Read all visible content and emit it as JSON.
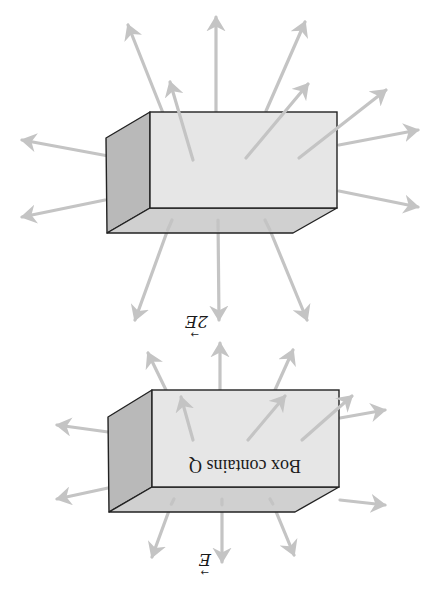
{
  "figure": {
    "orientation": "rotated 180 degrees (upside down)",
    "colors": {
      "background": "#ffffff",
      "front_face": "#e6e6e6",
      "side_face": "#b9b9b9",
      "bottom_face": "#d0d0d0",
      "edge": "#222222",
      "arrow": "#c4c4c4"
    },
    "panels": [
      {
        "name": "box-2E",
        "field_label": "2E",
        "field_label_vector": "→",
        "caption": "",
        "front": {
          "x1": 150,
          "y1": 112,
          "x2": 337,
          "y2": 208
        },
        "side": [
          [
            106,
            138
          ],
          [
            150,
            112
          ],
          [
            150,
            208
          ],
          [
            107,
            233
          ]
        ],
        "bottom": [
          [
            107,
            233
          ],
          [
            150,
            208
          ],
          [
            337,
            208
          ],
          [
            293,
            233
          ]
        ],
        "arrows": [
          [
            163,
            113,
            128,
            25
          ],
          [
            216,
            112,
            216,
            17
          ],
          [
            266,
            111,
            305,
            22
          ],
          [
            193,
            160,
            170,
            82
          ],
          [
            246,
            158,
            308,
            84
          ],
          [
            299,
            158,
            386,
            90
          ],
          [
            339,
            145,
            418,
            130
          ],
          [
            339,
            191,
            418,
            207
          ],
          [
            130,
            160,
            22,
            140
          ],
          [
            105,
            200,
            22,
            217
          ],
          [
            172,
            218,
            135,
            320
          ],
          [
            218,
            218,
            219,
            320
          ],
          [
            265,
            218,
            307,
            320
          ]
        ],
        "label_pos": {
          "x": 196,
          "y": 322
        }
      },
      {
        "name": "box-E",
        "field_label": "E",
        "field_label_vector": "→",
        "caption": "Box contains Q",
        "front": {
          "x1": 152,
          "y1": 390,
          "x2": 339,
          "y2": 487
        },
        "side": [
          [
            108,
            417
          ],
          [
            152,
            390
          ],
          [
            152,
            487
          ],
          [
            109,
            512
          ]
        ],
        "bottom": [
          [
            109,
            512
          ],
          [
            152,
            487
          ],
          [
            339,
            487
          ],
          [
            295,
            512
          ]
        ],
        "arrows": [
          [
            166,
            390,
            148,
            353
          ],
          [
            220,
            390,
            220,
            343
          ],
          [
            275,
            390,
            293,
            350
          ],
          [
            193,
            440,
            181,
            397
          ],
          [
            248,
            440,
            285,
            396
          ],
          [
            302,
            440,
            352,
            396
          ],
          [
            340,
            418,
            385,
            410
          ],
          [
            340,
            500,
            385,
            505
          ],
          [
            130,
            435,
            57,
            425
          ],
          [
            108,
            488,
            57,
            499
          ],
          [
            174,
            497,
            152,
            557
          ],
          [
            222,
            497,
            222,
            562
          ],
          [
            270,
            497,
            294,
            555
          ]
        ],
        "label_pos": {
          "x": 199,
          "y": 560
        },
        "caption_pos": {
          "x": 245,
          "y": 466
        }
      }
    ]
  }
}
